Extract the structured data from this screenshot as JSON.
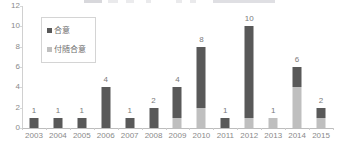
{
  "chart_data": {
    "type": "bar",
    "title": "",
    "xlabel": "",
    "ylabel": "",
    "ylim": [
      0,
      12
    ],
    "yticks": [
      0,
      2,
      4,
      6,
      8,
      10,
      12
    ],
    "grid": false,
    "stacked": true,
    "legend_position": "inside-top-left",
    "categories": [
      "2003",
      "2004",
      "2005",
      "2006",
      "2007",
      "2008",
      "2009",
      "2010",
      "2011",
      "2012",
      "2013",
      "2014",
      "2015"
    ],
    "series": [
      {
        "name": "付随合意",
        "color": "#BFBFBF",
        "values": [
          0,
          0,
          0,
          0,
          0,
          0,
          1,
          2,
          0,
          1,
          1,
          4,
          1
        ]
      },
      {
        "name": "合意",
        "color": "#595959",
        "values": [
          1,
          1,
          1,
          4,
          1,
          2,
          3,
          6,
          1,
          9,
          0,
          2,
          1
        ]
      }
    ],
    "totals": [
      1,
      1,
      1,
      4,
      1,
      2,
      4,
      8,
      1,
      10,
      1,
      6,
      2
    ],
    "data_labels": [
      "1",
      "1",
      "1",
      "4",
      "1",
      "2",
      "4",
      "8",
      "1",
      "10",
      "1",
      "6",
      "2"
    ]
  },
  "legend": {
    "items": [
      {
        "label": "合意",
        "color": "#595959"
      },
      {
        "label": "付随合意",
        "color": "#BFBFBF"
      }
    ]
  },
  "axes": {
    "y_tick_labels": [
      "12",
      "10",
      "8",
      "6",
      "4",
      "2",
      "0"
    ],
    "x_tick_labels": [
      "2003",
      "2004",
      "2005",
      "2006",
      "2007",
      "2008",
      "2009",
      "2010",
      "2011",
      "2012",
      "2013",
      "2014",
      "2015"
    ]
  }
}
